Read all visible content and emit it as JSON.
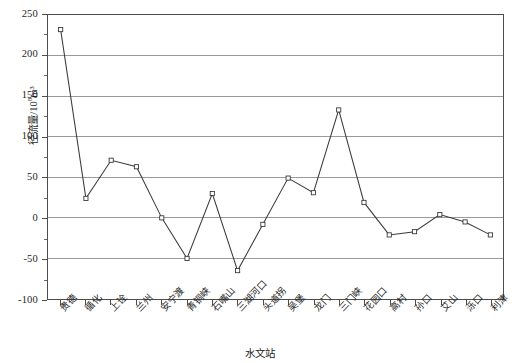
{
  "chart_data": {
    "type": "line",
    "title": "",
    "xlabel": "水文站",
    "ylabel": "径流量/10⁸m³",
    "ylabel_base": "径流量/10",
    "ylabel_sup": "8",
    "ylabel_tail": "m³",
    "ylim": [
      -100,
      250
    ],
    "ytick_values": [
      250,
      200,
      150,
      100,
      50,
      0,
      -50,
      -100
    ],
    "ytick_labels": [
      "250",
      "200",
      "150",
      "100",
      "50",
      "0",
      "-50",
      "-100"
    ],
    "yminor_step": 25,
    "grid": "horizontal",
    "legend": "none",
    "marker": "open-square",
    "categories": [
      "贵德",
      "循化",
      "上诠",
      "兰州",
      "安宁渡",
      "青铜峡",
      "石嘴山",
      "三湖河口",
      "头道拐",
      "吴堡",
      "龙门",
      "三门峡",
      "花园口",
      "高村",
      "孙口",
      "艾山",
      "泺口",
      "利津"
    ],
    "values": [
      232,
      24,
      71,
      63,
      0,
      -50,
      30,
      -65,
      -8,
      49,
      31,
      133,
      19,
      -21,
      -17,
      4,
      -5,
      -21
    ],
    "series": [
      {
        "name": "径流量",
        "values": [
          232,
          24,
          71,
          63,
          0,
          -50,
          30,
          -65,
          -8,
          49,
          31,
          133,
          19,
          -21,
          -17,
          4,
          -5,
          -21
        ]
      }
    ]
  },
  "colors": {
    "line": "#3a3a3a",
    "grid": "#8e8e8e",
    "frame": "#4d4d4d",
    "background": "#ffffff",
    "text": "#262626"
  }
}
